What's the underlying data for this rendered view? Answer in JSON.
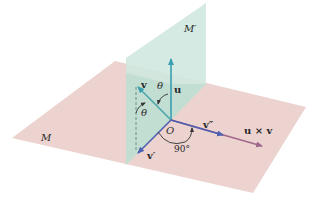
{
  "figure": {
    "type": "3d-geometry-diagram",
    "planes": [
      {
        "id": "M",
        "label": "M",
        "color": "#ecd2cf",
        "orientation": "horizontal"
      },
      {
        "id": "M_prime",
        "label": "M′",
        "color": "#cfe8e0",
        "orientation": "vertical"
      }
    ],
    "origin": {
      "label": "O"
    },
    "vectors": [
      {
        "id": "u",
        "label": "u",
        "color": "#3a9fb0"
      },
      {
        "id": "v",
        "label": "v",
        "color": "#4aa7a8"
      },
      {
        "id": "v_prime",
        "label": "v′",
        "color": "#4d5fb0"
      },
      {
        "id": "v_double_prime",
        "label": "v″",
        "color": "#4d5fb0"
      },
      {
        "id": "u_cross_v",
        "label": "u × v",
        "color": "#a0688a"
      }
    ],
    "angles": [
      {
        "id": "theta_uv",
        "label": "θ",
        "between": [
          "u",
          "v"
        ]
      },
      {
        "id": "theta_vvp",
        "label": "θ",
        "between": [
          "v",
          "v_prime"
        ]
      },
      {
        "id": "right_angle",
        "label": "90°",
        "between": [
          "v_prime",
          "v_double_prime"
        ]
      }
    ]
  }
}
